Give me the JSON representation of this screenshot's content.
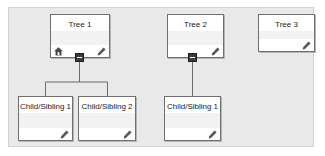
{
  "panel": {
    "background_color": "#e9e9e9",
    "border_color": "#d2d2d2"
  },
  "diagram": {
    "type": "tree-hierarchy",
    "node_border_color": "#6f6f6f",
    "node_background_color": "#ffffff",
    "connector_color": "#6b6b6b",
    "toggle_color": "#3b3b3b",
    "roots": [
      {
        "id": "tree1",
        "label": "Tree 1",
        "icons": [
          "home-icon",
          "edit-icon"
        ],
        "expanded": true,
        "toggle_state": "minus",
        "children": [
          "child1-1",
          "child1-2"
        ]
      },
      {
        "id": "tree2",
        "label": "Tree 2",
        "icons": [
          "edit-icon"
        ],
        "expanded": true,
        "toggle_state": "minus",
        "children": [
          "child2-1"
        ]
      },
      {
        "id": "tree3",
        "label": "Tree 3",
        "icons": [
          "edit-icon"
        ],
        "expanded": false,
        "toggle_state": "none",
        "children": []
      }
    ],
    "children": [
      {
        "id": "child1-1",
        "label": "Child/Sibling 1",
        "icons": [
          "edit-icon"
        ],
        "parent": "tree1"
      },
      {
        "id": "child1-2",
        "label": "Child/Sibling 2",
        "icons": [
          "edit-icon"
        ],
        "parent": "tree1"
      },
      {
        "id": "child2-1",
        "label": "Child/Sibling 1",
        "icons": [
          "edit-icon"
        ],
        "parent": "tree2"
      }
    ]
  }
}
